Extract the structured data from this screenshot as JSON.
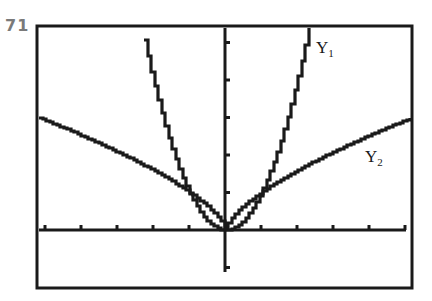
{
  "figure": {
    "label": "71"
  },
  "chart_data": {
    "type": "line",
    "title": "",
    "xlabel": "",
    "ylabel": "",
    "xlim": [
      -5.2,
      5.2
    ],
    "ylim": [
      -1.6,
      5.5
    ],
    "xscl": 1,
    "yscl": 1,
    "grid": false,
    "frame": true,
    "series": [
      {
        "name": "Y1",
        "label": "Y",
        "subscript": "1",
        "expression": "x^2",
        "x": [
          -2.35,
          -2,
          -1.5,
          -1,
          -0.5,
          0,
          0.5,
          1,
          1.5,
          2,
          2.35
        ],
        "y": [
          5.52,
          4,
          2.25,
          1,
          0.25,
          0,
          0.25,
          1,
          2.25,
          4,
          5.52
        ]
      },
      {
        "name": "Y2",
        "label": "Y",
        "subscript": "2",
        "expression": "x^(2/3)",
        "x": [
          -5.2,
          -4,
          -3,
          -2,
          -1,
          0,
          1,
          2,
          3,
          4,
          5
        ],
        "y": [
          3.0,
          2.52,
          2.08,
          1.59,
          1.0,
          0,
          1.0,
          1.59,
          2.08,
          2.52,
          2.92
        ]
      }
    ],
    "annotations": [
      {
        "text": "Y1",
        "x": 2.6,
        "y": 5.0
      },
      {
        "text": "Y2",
        "x": 4.1,
        "y": 1.7
      }
    ]
  },
  "colors": {
    "ink": "#1a1a1a",
    "background": "#ffffff",
    "figure_label": "#7a7a7a"
  }
}
